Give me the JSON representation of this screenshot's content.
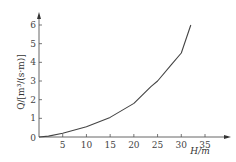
{
  "chart_data": {
    "type": "line",
    "title": "",
    "xlabel": "H/m",
    "ylabel": "Q/[m³/(s·m)]",
    "xlim": [
      0,
      37
    ],
    "ylim": [
      0,
      6.5
    ],
    "xticks": [
      0,
      5,
      10,
      15,
      20,
      25,
      30,
      35
    ],
    "yticks": [
      1,
      2,
      3,
      4,
      5,
      6
    ],
    "grid": false,
    "legend": null,
    "series": [
      {
        "name": "Q-H curve",
        "x": [
          0,
          2,
          5,
          10,
          15,
          20,
          23.6,
          25,
          28,
          30,
          32
        ],
        "y": [
          0,
          0.05,
          0.2,
          0.55,
          1.05,
          1.8,
          2.7,
          3.0,
          3.9,
          4.5,
          6.0
        ]
      }
    ]
  },
  "axes": {
    "origin_label": "0",
    "x_label": "H/m",
    "y_label": "Q/[m³/(s·m)]"
  }
}
